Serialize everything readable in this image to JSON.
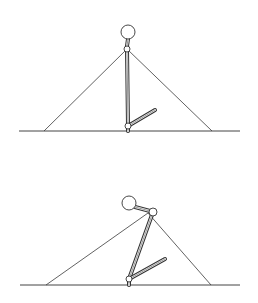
{
  "diagram": {
    "colors": {
      "background": "#ffffff",
      "stroke": "#333333"
    },
    "panels": [
      {
        "id": "upright",
        "ground": {
          "x1": 19,
          "x2": 240,
          "y": 131
        },
        "triangle": {
          "left": [
            44,
            131
          ],
          "apex": [
            127,
            49
          ],
          "right": [
            212,
            131
          ]
        },
        "head": {
          "cx": 128,
          "cy": 32,
          "r": 7
        },
        "neck": [
          [
            128,
            39
          ],
          [
            127,
            46
          ]
        ],
        "upper_joint": {
          "cx": 127,
          "cy": 49,
          "r": 3
        },
        "main_strut": [
          [
            127,
            49
          ],
          [
            128,
            126
          ]
        ],
        "lower_joint": {
          "cx": 128,
          "cy": 126,
          "r": 3
        },
        "arm": [
          [
            128,
            126
          ],
          [
            155,
            110
          ]
        ],
        "foot": [
          [
            128,
            126
          ],
          [
            128,
            131
          ]
        ]
      },
      {
        "id": "bent",
        "ground": {
          "x1": 20,
          "x2": 240,
          "y": 285
        },
        "triangle": {
          "left": [
            46,
            285
          ],
          "apex": [
            148,
            213
          ],
          "right": [
            211,
            285
          ]
        },
        "head": {
          "cx": 129,
          "cy": 203,
          "r": 7
        },
        "neck": [
          [
            135,
            207
          ],
          [
            150,
            211
          ]
        ],
        "upper_joint": {
          "cx": 153,
          "cy": 212,
          "r": 4
        },
        "main_strut": [
          [
            153,
            212
          ],
          [
            129,
            279
          ]
        ],
        "lower_joint": {
          "cx": 129,
          "cy": 279,
          "r": 3
        },
        "arm": [
          [
            129,
            279
          ],
          [
            165,
            259
          ]
        ],
        "foot": [
          [
            129,
            279
          ],
          [
            129,
            285
          ]
        ]
      }
    ]
  }
}
